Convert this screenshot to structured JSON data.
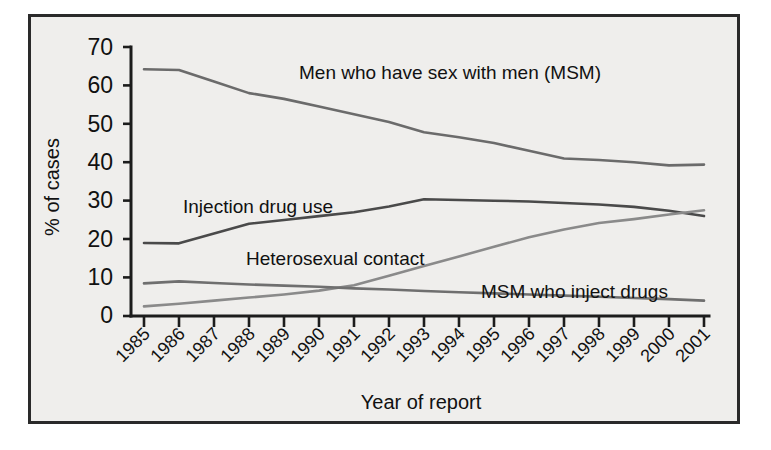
{
  "chart_data": {
    "type": "line",
    "title": "",
    "xlabel": "Year of report",
    "ylabel": "% of cases",
    "ylim": [
      0,
      70
    ],
    "yticks": [
      0,
      10,
      20,
      30,
      40,
      50,
      60,
      70
    ],
    "grid": false,
    "legend_position": "inline-labels",
    "categories": [
      "1985",
      "1986",
      "1987",
      "1988",
      "1989",
      "1990",
      "1991",
      "1992",
      "1993",
      "1994",
      "1995",
      "1996",
      "1997",
      "1998",
      "1999",
      "2000",
      "2001"
    ],
    "series": [
      {
        "name": "Men who have sex with men (MSM)",
        "color": "#6b6b6b",
        "values": [
          64.2,
          64.0,
          61.0,
          58.0,
          56.5,
          54.5,
          52.5,
          50.5,
          47.8,
          46.5,
          45.0,
          43.0,
          41.0,
          40.6,
          40.0,
          39.2,
          39.4
        ]
      },
      {
        "name": "Injection drug use",
        "color": "#4a4a4a",
        "values": [
          19.0,
          18.9,
          21.5,
          24.0,
          25.0,
          26.0,
          27.0,
          28.5,
          30.4,
          30.2,
          30.0,
          29.8,
          29.4,
          29.0,
          28.4,
          27.4,
          26.0
        ]
      },
      {
        "name": "Heterosexual contact",
        "color": "#8a8a8a",
        "values": [
          2.5,
          3.2,
          4.0,
          4.8,
          5.6,
          6.6,
          8.0,
          10.5,
          13.0,
          15.5,
          18.0,
          20.5,
          22.5,
          24.2,
          25.2,
          26.4,
          27.5
        ]
      },
      {
        "name": "MSM who inject drugs",
        "color": "#6f6f6f",
        "values": [
          8.5,
          9.0,
          8.6,
          8.2,
          7.9,
          7.6,
          7.2,
          6.9,
          6.5,
          6.2,
          5.9,
          5.6,
          5.3,
          5.0,
          4.7,
          4.4,
          4.0
        ]
      }
    ],
    "annotations": [
      {
        "text": "Men who have sex with men (MSM)",
        "series": "Men who have sex with men (MSM)"
      },
      {
        "text": "Injection drug use",
        "series": "Injection drug use"
      },
      {
        "text": "Heterosexual contact",
        "series": "Heterosexual contact"
      },
      {
        "text": "MSM who inject drugs",
        "series": "MSM who inject drugs"
      }
    ]
  },
  "labels": {
    "ylabel": "% of cases",
    "xlabel": "Year of report",
    "msm": "Men who have sex with men (MSM)",
    "idu": "Injection drug use",
    "het": "Heterosexual contact",
    "msm_idu": "MSM who inject drugs",
    "y_0": "0",
    "y_10": "10",
    "y_20": "20",
    "y_30": "30",
    "y_40": "40",
    "y_50": "50",
    "y_60": "60",
    "y_70": "70",
    "x_1985": "1985",
    "x_1986": "1986",
    "x_1987": "1987",
    "x_1988": "1988",
    "x_1989": "1989",
    "x_1990": "1990",
    "x_1991": "1991",
    "x_1992": "1992",
    "x_1993": "1993",
    "x_1994": "1994",
    "x_1995": "1995",
    "x_1996": "1996",
    "x_1997": "1997",
    "x_1998": "1998",
    "x_1999": "1999",
    "x_2000": "2000",
    "x_2001": "2001"
  }
}
